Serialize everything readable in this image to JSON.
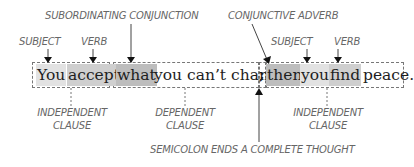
{
  "diagram": {
    "labels": {
      "subordinating_conjunction": "SUBORDINATING CONJUNCTION",
      "conjunctive_adverb": "CONJUNCTIVE ADVERB",
      "subject_1": "SUBJECT",
      "verb_1": "VERB",
      "subject_2": "SUBJECT",
      "verb_2": "VERB",
      "independent_clause_1_line1": "INDEPENDENT",
      "independent_clause_1_line2": "CLAUSE",
      "dependent_clause_line1": "DEPENDENT",
      "dependent_clause_line2": "CLAUSE",
      "independent_clause_2_line1": "INDEPENDENT",
      "independent_clause_2_line2": "CLAUSE",
      "semicolon_note": "SEMICOLON ENDS A COMPLETE THOUGHT"
    },
    "sentence": {
      "w1": "You",
      "w2": "accept",
      "w3": "what",
      "w4": "you can’t change",
      "semicolon": ";",
      "w5": "then",
      "w6": "you",
      "w7": "find",
      "w8": "peace."
    },
    "colors": {
      "highlight_light": "#e2e2e2",
      "highlight_mid": "#cfcfcf",
      "highlight_dark": "#bdbdbd",
      "label_text": "#666666",
      "sentence_text": "#1e1e1e"
    }
  }
}
